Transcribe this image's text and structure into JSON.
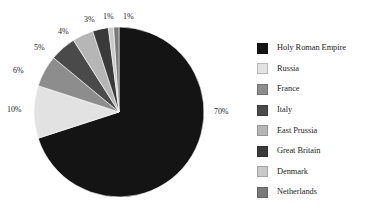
{
  "chart_data": {
    "type": "pie",
    "title": "",
    "subtitle": "",
    "xlabel": "",
    "ylabel": "",
    "grid": false,
    "legend_position": "right",
    "units": "percent",
    "total": 101,
    "categories": [
      "Holy Roman Empire",
      "Russia",
      "France",
      "Italy",
      "East Prussia",
      "Great Britain",
      "Denmark",
      "Netherlands"
    ],
    "values": [
      70,
      10,
      6,
      5,
      4,
      3,
      1,
      1
    ],
    "data_labels": [
      "70%",
      "10%",
      "6%",
      "5%",
      "4%",
      "3%",
      "1%",
      "1%"
    ],
    "slice_colors": [
      "#141414",
      "#e2e2e2",
      "#8d8d8d",
      "#4a4a4a",
      "#b6b6b6",
      "#3a3a3a",
      "#c9c9c9",
      "#7a7a7a"
    ],
    "slices": [
      {
        "label": "Holy Roman Empire",
        "value": 70,
        "data_label": "70%",
        "color": "#141414"
      },
      {
        "label": "Russia",
        "value": 10,
        "data_label": "10%",
        "color": "#e2e2e2"
      },
      {
        "label": "France",
        "value": 6,
        "data_label": "6%",
        "color": "#8d8d8d"
      },
      {
        "label": "Italy",
        "value": 5,
        "data_label": "5%",
        "color": "#4a4a4a"
      },
      {
        "label": "East Prussia",
        "value": 4,
        "data_label": "4%",
        "color": "#b6b6b6"
      },
      {
        "label": "Great Britain",
        "value": 3,
        "data_label": "3%",
        "color": "#3a3a3a"
      },
      {
        "label": "Denmark",
        "value": 1,
        "data_label": "1%",
        "color": "#c9c9c9"
      },
      {
        "label": "Netherlands",
        "value": 1,
        "data_label": "1%",
        "color": "#7a7a7a"
      }
    ]
  },
  "legend": {
    "items": [
      {
        "label": "Holy Roman Empire",
        "color": "#141414"
      },
      {
        "label": "Russia",
        "color": "#e2e2e2"
      },
      {
        "label": "France",
        "color": "#8d8d8d"
      },
      {
        "label": "Italy",
        "color": "#4a4a4a"
      },
      {
        "label": "East Prussia",
        "color": "#b6b6b6"
      },
      {
        "label": "Great Britain",
        "color": "#3a3a3a"
      },
      {
        "label": "Denmark",
        "color": "#c9c9c9"
      },
      {
        "label": "Netherlands",
        "color": "#7a7a7a"
      }
    ]
  },
  "labels": {
    "l70": "70%",
    "l10": "10%",
    "l6": "6%",
    "l5": "5%",
    "l4": "4%",
    "l3": "3%",
    "l1a": "1%",
    "l1b": "1%"
  },
  "geometry": {
    "center_x": 119,
    "center_y": 112,
    "radius": 85,
    "background": "#ffffff"
  }
}
